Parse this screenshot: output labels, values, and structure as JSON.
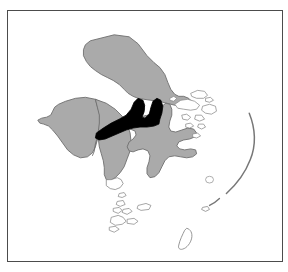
{
  "figure": {
    "kind": "locator-map",
    "title": "",
    "caption": "",
    "background_color": "#ffffff",
    "frame": {
      "visible": true,
      "border_color": "#4c4c4c",
      "border_width_px": 1.5,
      "fill_color": "#ffffff",
      "left_px": 7,
      "top_px": 10,
      "width_px": 276,
      "height_px": 252
    }
  },
  "map": {
    "region_name": "",
    "projection_note": "",
    "colors": {
      "land_fill": "#aaaaaa",
      "land_stroke": "#6e6e6e",
      "highlight_fill": "#000000",
      "highlight_stroke": "#000000",
      "water_fill": "#ffffff",
      "island_stroke": "#888888",
      "inner_boundary_stroke": "#6e6e6e"
    },
    "layers": [
      {
        "id": "northern-landmass",
        "label": "",
        "style": "land",
        "note": "large northern island body"
      },
      {
        "id": "western-landmass",
        "label": "",
        "style": "land",
        "note": "western island body with internal boundaries"
      },
      {
        "id": "southern-peninsula",
        "label": "",
        "style": "land",
        "note": "south trending peninsula"
      },
      {
        "id": "eastern-landmass",
        "label": "",
        "style": "land",
        "note": "eastern multi-armed island"
      },
      {
        "id": "eastern-outline-islands",
        "label": "",
        "style": "outline",
        "note": "unfilled island outlines east of the main body"
      },
      {
        "id": "southern-island-chain",
        "label": "",
        "style": "outline",
        "note": "small unfilled islands trailing south"
      },
      {
        "id": "far-east-arc",
        "label": "",
        "style": "outline",
        "note": "thin arc shaped island chain at far east"
      },
      {
        "id": "bottom-islet",
        "label": "",
        "style": "outline",
        "note": "small islet near bottom centre"
      },
      {
        "id": "highlight-region",
        "label": "",
        "style": "highlight",
        "note": "selected administrative region rendered solid black"
      }
    ],
    "highlight": {
      "present": true,
      "fill": "#000000",
      "description": "elongated east-west region with two northward lobes, located at the centre of the map"
    }
  },
  "annotations": {
    "labels": [],
    "scale_bar": null,
    "north_arrow": null,
    "legend": null
  }
}
